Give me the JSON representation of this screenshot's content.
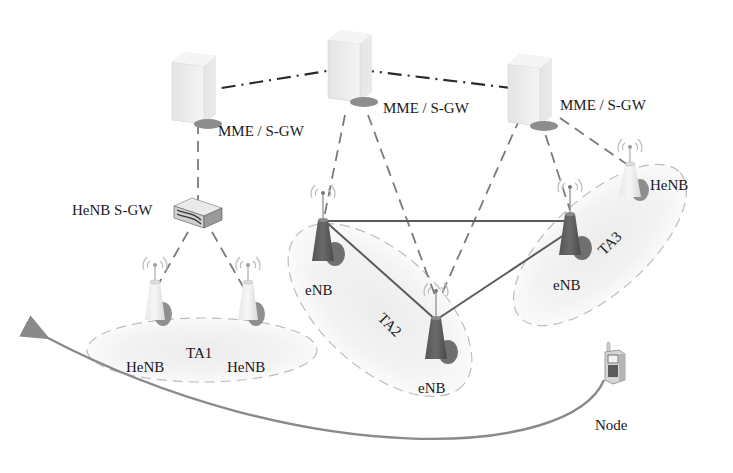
{
  "diagram": {
    "type": "LTE network architecture with tracking areas",
    "core": {
      "servers": [
        {
          "id": "mme1",
          "label": "MME / S-GW"
        },
        {
          "id": "mme2",
          "label": "MME / S-GW"
        },
        {
          "id": "mme3",
          "label": "MME / S-GW"
        }
      ]
    },
    "gateway": {
      "id": "henb-sgw",
      "label": "HeNB S-GW"
    },
    "tracking_areas": [
      {
        "id": "ta1",
        "label": "TA1"
      },
      {
        "id": "ta2",
        "label": "TA2"
      },
      {
        "id": "ta3",
        "label": "TA3"
      }
    ],
    "stations": [
      {
        "id": "henb1",
        "label": "HeNB",
        "area": "TA1"
      },
      {
        "id": "henb2",
        "label": "HeNB",
        "area": "TA1"
      },
      {
        "id": "enb1",
        "label": "eNB",
        "area": "TA2"
      },
      {
        "id": "enb2",
        "label": "eNB",
        "area": "TA2"
      },
      {
        "id": "enb3",
        "label": "eNB",
        "area": "TA3"
      },
      {
        "id": "henb3",
        "label": "HeNB",
        "area": "TA3"
      }
    ],
    "mobile": {
      "id": "node",
      "label": "Node"
    },
    "links": {
      "core_interconnect": "dash-dot",
      "s1": "dashed",
      "x2": "solid",
      "movement": "curved arrow from Node toward TA1"
    }
  }
}
